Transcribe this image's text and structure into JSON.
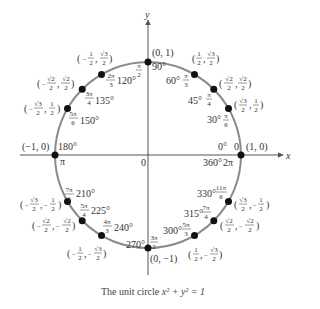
{
  "title": "The unit circle",
  "caption": {
    "text": "The unit circle x² + y² = 1",
    "prefix": "The unit circle ",
    "equation": "x² + y² = 1"
  },
  "axes": {
    "x_label": "x",
    "y_label": "y",
    "origin_label": "0"
  },
  "colors": {
    "circle": "#8a8a8a",
    "axes": "#555555",
    "points": "#111111",
    "text": "#333333"
  },
  "points": [
    {
      "deg": "0°",
      "rad": "0",
      "coord": "(1, 0)",
      "deg_alt": "360°",
      "rad_alt": "2π"
    },
    {
      "deg": "30°",
      "rad": "π/6",
      "coord": "(√3/2, 1/2)"
    },
    {
      "deg": "45°",
      "rad": "π/4",
      "coord": "(√2/2, √2/2)"
    },
    {
      "deg": "60°",
      "rad": "π/3",
      "coord": "(1/2, √3/2)"
    },
    {
      "deg": "90°",
      "rad": "π/2",
      "coord": "(0, 1)"
    },
    {
      "deg": "120°",
      "rad": "2π/3",
      "coord": "(−1/2, √3/2)"
    },
    {
      "deg": "135°",
      "rad": "3π/4",
      "coord": "(−√2/2, √2/2)"
    },
    {
      "deg": "150°",
      "rad": "5π/6",
      "coord": "(−√3/2, 1/2)"
    },
    {
      "deg": "180°",
      "rad": "π",
      "coord": "(−1, 0)"
    },
    {
      "deg": "210°",
      "rad": "7π/6",
      "coord": "(−√3/2, −1/2)"
    },
    {
      "deg": "225°",
      "rad": "5π/4",
      "coord": "(−√2/2, −√2/2)"
    },
    {
      "deg": "240°",
      "rad": "4π/3",
      "coord": "(−1/2, −√3/2)"
    },
    {
      "deg": "270°",
      "rad": "3π/2",
      "coord": "(0, −1)"
    },
    {
      "deg": "300°",
      "rad": "5π/3",
      "coord": "(1/2, −√3/2)"
    },
    {
      "deg": "315°",
      "rad": "7π/4",
      "coord": "(√2/2, −√2/2)"
    },
    {
      "deg": "330°",
      "rad": "11π/6",
      "coord": "(√3/2, −1/2)"
    }
  ],
  "labels": {
    "p0": {
      "deg": "0°",
      "rad": "0",
      "coord": "(1, 0)",
      "deg2": "360°",
      "rad2": "2π"
    },
    "p30": {
      "deg": "30°",
      "rad_n": "π",
      "rad_d": "6",
      "x_n": "√3",
      "x_d": "2",
      "y_n": "1",
      "y_d": "2"
    },
    "p45": {
      "deg": "45°",
      "rad_n": "π",
      "rad_d": "4",
      "x_n": "√2",
      "x_d": "2",
      "y_n": "√2",
      "y_d": "2"
    },
    "p60": {
      "deg": "60°",
      "rad_n": "π",
      "rad_d": "3",
      "x_n": "1",
      "x_d": "2",
      "y_n": "√3",
      "y_d": "2"
    },
    "p90": {
      "deg": "90°",
      "rad_n": "π",
      "rad_d": "2",
      "coord": "(0, 1)"
    },
    "p120": {
      "deg": "120°",
      "rad_n": "2π",
      "rad_d": "3",
      "x_n": "1",
      "x_d": "2",
      "y_n": "√3",
      "y_d": "2"
    },
    "p135": {
      "deg": "135°",
      "rad_n": "3π",
      "rad_d": "4",
      "x_n": "√2",
      "x_d": "2",
      "y_n": "√2",
      "y_d": "2"
    },
    "p150": {
      "deg": "150°",
      "rad_n": "5π",
      "rad_d": "6",
      "x_n": "√3",
      "x_d": "2",
      "y_n": "1",
      "y_d": "2"
    },
    "p180": {
      "deg": "180°",
      "rad": "π",
      "coord": "(−1, 0)"
    },
    "p210": {
      "deg": "210°",
      "rad_n": "7π",
      "rad_d": "6",
      "x_n": "√3",
      "x_d": "2",
      "y_n": "1",
      "y_d": "2"
    },
    "p225": {
      "deg": "225°",
      "rad_n": "5π",
      "rad_d": "4",
      "x_n": "√2",
      "x_d": "2",
      "y_n": "√2",
      "y_d": "2"
    },
    "p240": {
      "deg": "240°",
      "rad_n": "4π",
      "rad_d": "3",
      "x_n": "1",
      "x_d": "2",
      "y_n": "√3",
      "y_d": "2"
    },
    "p270": {
      "deg": "270°",
      "rad_n": "3π",
      "rad_d": "2",
      "coord": "(0, −1)"
    },
    "p300": {
      "deg": "300°",
      "rad_n": "5π",
      "rad_d": "3",
      "x_n": "1",
      "x_d": "2",
      "y_n": "√3",
      "y_d": "2"
    },
    "p315": {
      "deg": "315°",
      "rad_n": "7π",
      "rad_d": "4",
      "x_n": "√2",
      "x_d": "2",
      "y_n": "√2",
      "y_d": "2"
    },
    "p330": {
      "deg": "330°",
      "rad_n": "11π",
      "rad_d": "6",
      "x_n": "√3",
      "x_d": "2",
      "y_n": "1",
      "y_d": "2"
    },
    "open": "(",
    "close": ")",
    "comma": ",",
    "minus": "−"
  }
}
